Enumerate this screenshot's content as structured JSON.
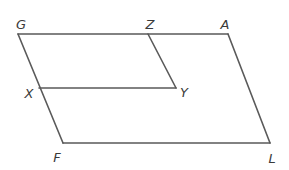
{
  "figure": {
    "stroke_color": "#5a5a5a",
    "label_color": "#3a3a3a",
    "vertices": {
      "G": {
        "label": "G",
        "x": 18,
        "y": 34,
        "label_x": 21,
        "label_y": 24
      },
      "Z": {
        "label": "Z",
        "x": 148,
        "y": 34,
        "label_x": 150,
        "label_y": 24
      },
      "A": {
        "label": "A",
        "x": 228,
        "y": 34,
        "label_x": 225,
        "label_y": 24
      },
      "X": {
        "label": "X",
        "x": 39,
        "y": 88,
        "label_x": 29,
        "label_y": 93
      },
      "Y": {
        "label": "Y",
        "x": 176,
        "y": 88,
        "label_x": 184,
        "label_y": 92
      },
      "F": {
        "label": "F",
        "x": 63,
        "y": 143,
        "label_x": 57,
        "label_y": 157
      },
      "L": {
        "label": "L",
        "x": 270,
        "y": 143,
        "label_x": 272,
        "label_y": 158
      }
    },
    "segments": [
      {
        "name": "segment-GA",
        "from": "G",
        "to": "A"
      },
      {
        "name": "segment-AL",
        "from": "A",
        "to": "L"
      },
      {
        "name": "segment-LF",
        "from": "L",
        "to": "F"
      },
      {
        "name": "segment-FG",
        "from": "F",
        "to": "G"
      },
      {
        "name": "segment-ZY",
        "from": "Z",
        "to": "Y"
      },
      {
        "name": "segment-YX",
        "from": "Y",
        "to": "X"
      }
    ],
    "shapes": [
      {
        "name": "outer-parallelogram",
        "vertices": [
          "G",
          "A",
          "L",
          "F"
        ]
      },
      {
        "name": "inner-parallelogram",
        "vertices": [
          "G",
          "Z",
          "Y",
          "X"
        ]
      }
    ]
  }
}
